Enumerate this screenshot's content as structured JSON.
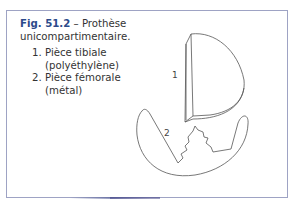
{
  "figure": {
    "number": "Fig. 51.2",
    "title_sep": " – ",
    "title": "Prothèse unicompartimentaire.",
    "items": [
      {
        "label": "Pièce tibiale (polyéthylène)"
      },
      {
        "label": "Pièce fémorale (métal)"
      }
    ],
    "diagram_labels": {
      "tibial": "1",
      "femoral": "2"
    },
    "colors": {
      "fig_number": "#2b4a8a",
      "frame": "#9ea3c4",
      "line": "#555555"
    }
  }
}
